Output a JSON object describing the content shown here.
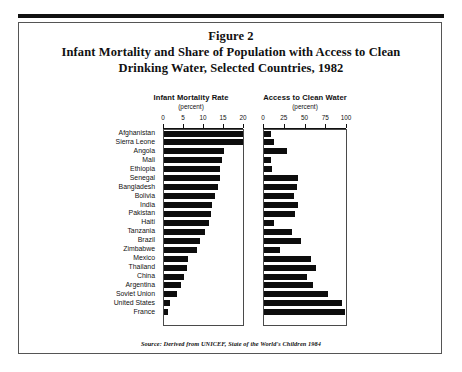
{
  "title": {
    "line1": "Figure 2",
    "line2": "Infant Mortality and Share of Population with Access to Clean",
    "line3": "Drinking Water, Selected Countries, 1982"
  },
  "panels": {
    "mortality": {
      "heading": "Infant Mortality Rate",
      "unit": "(percent)"
    },
    "water": {
      "heading": "Access to Clean Water",
      "unit": "(percent)"
    }
  },
  "source": "Source: Derived from UNICEF, State of the World's Children 1984",
  "chart_data": {
    "type": "bar",
    "title": "Infant Mortality and Share of Population with Access to Clean Drinking Water, Selected Countries, 1982",
    "orientation": "horizontal",
    "grid": false,
    "legend": "none",
    "categories": [
      "Afghanistan",
      "Sierra Leone",
      "Angola",
      "Mali",
      "Ethiopia",
      "Senegal",
      "Bangladesh",
      "Bolivia",
      "India",
      "Pakistan",
      "Haiti",
      "Tanzania",
      "Brazil",
      "Zimbabwe",
      "Mexico",
      "Thailand",
      "China",
      "Argentina",
      "Soviet Union",
      "United States",
      "France"
    ],
    "series": [
      {
        "name": "Infant Mortality Rate",
        "xlabel": "(percent)",
        "xlim": [
          0,
          20
        ],
        "ticks": [
          0,
          5,
          10,
          15,
          20
        ],
        "values": [
          20,
          20,
          15.2,
          14.8,
          14.3,
          14.1,
          13.6,
          12.9,
          12.1,
          12.0,
          11.4,
          10.4,
          9.1,
          8.3,
          6.2,
          5.8,
          5.0,
          4.4,
          3.2,
          1.6,
          1.0
        ]
      },
      {
        "name": "Access to Clean Water",
        "xlabel": "(percent)",
        "xlim": [
          0,
          100
        ],
        "ticks": [
          0,
          25,
          50,
          75,
          100
        ],
        "values": [
          9,
          12,
          28,
          9,
          10,
          42,
          40,
          36,
          42,
          38,
          12,
          34,
          45,
          20,
          57,
          64,
          52,
          60,
          78,
          95,
          99
        ]
      }
    ]
  }
}
